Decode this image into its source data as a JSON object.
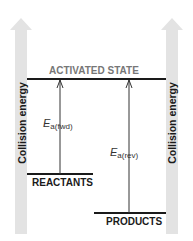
{
  "diagram": {
    "axis_label_left": "Collision energy",
    "axis_label_right": "Collision energy",
    "activated_state_label": "ACTIVATED STATE",
    "reactants_label": "REACTANTS",
    "products_label": "PRODUCTS",
    "ea_forward": {
      "symbol": "E",
      "subscript": "a(fwd)"
    },
    "ea_reverse": {
      "symbol": "E",
      "subscript": "a(rev)"
    },
    "colors": {
      "energy_arrow": "#e3e3e3",
      "line": "#1a1a1a",
      "activated_state_text": "#777777",
      "label_text": "#1a1a1a"
    }
  }
}
